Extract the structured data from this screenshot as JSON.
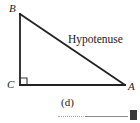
{
  "figure": {
    "type": "right-triangle-diagram",
    "background_color": "#ffffff",
    "stroke_color": "#222222",
    "vertices": {
      "B": {
        "label": "B",
        "x": 20,
        "y": 14,
        "position": "top-left"
      },
      "C": {
        "label": "C",
        "x": 20,
        "y": 85,
        "position": "bottom-left"
      },
      "A": {
        "label": "A",
        "x": 125,
        "y": 85,
        "position": "bottom-right"
      }
    },
    "sides": [
      {
        "name": "leg-vertical",
        "from": "B",
        "to": "C",
        "label": ""
      },
      {
        "name": "leg-horizontal",
        "from": "C",
        "to": "A",
        "label": ""
      },
      {
        "name": "hypotenuse",
        "from": "B",
        "to": "A",
        "label": "Hypotenuse"
      }
    ],
    "right_angle": {
      "at": "C",
      "marker": "open-square",
      "size": 7
    },
    "hypotenuse_label": "Hypotenuse"
  },
  "caption": {
    "text": "(d)",
    "rule_dotted_color": "#a8a8a8",
    "rule_solid_color": "#8a8a8a",
    "block_color": "#3a3a3a"
  }
}
